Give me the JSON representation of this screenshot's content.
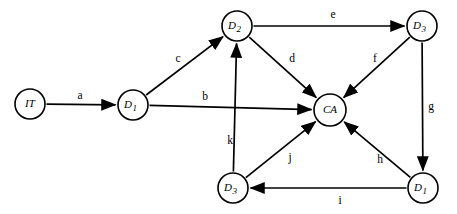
{
  "diagram": {
    "type": "directed-graph",
    "title": "",
    "background_color": "#ffffff",
    "stroke_color": "#000000",
    "node_fill_color": "#ffffff",
    "nodes": [
      {
        "id": "IT",
        "label": "IT",
        "base": "IT",
        "sub": "",
        "cx": 30,
        "cy": 104,
        "r": 15
      },
      {
        "id": "D1a",
        "label": "D1",
        "base": "D",
        "sub": "1",
        "cx": 133,
        "cy": 105,
        "r": 15
      },
      {
        "id": "D2",
        "label": "D2",
        "base": "D",
        "sub": "2",
        "cx": 237,
        "cy": 26,
        "r": 15
      },
      {
        "id": "D3top",
        "label": "D3",
        "base": "D",
        "sub": "3",
        "cx": 422,
        "cy": 26,
        "r": 15
      },
      {
        "id": "CA",
        "label": "CA",
        "base": "CA",
        "sub": "",
        "cx": 330,
        "cy": 110,
        "r": 16
      },
      {
        "id": "D3bot",
        "label": "D3",
        "base": "D",
        "sub": "3",
        "cx": 233,
        "cy": 188,
        "r": 15
      },
      {
        "id": "D1b",
        "label": "D1",
        "base": "D",
        "sub": "1",
        "cx": 423,
        "cy": 188,
        "r": 15
      }
    ],
    "edges": [
      {
        "id": "a",
        "label": "a",
        "from": "IT",
        "to": "D1a",
        "label_x": 80,
        "label_y": 96
      },
      {
        "id": "b",
        "label": "b",
        "from": "D1a",
        "to": "CA",
        "label_x": 205,
        "label_y": 97
      },
      {
        "id": "c",
        "label": "c",
        "from": "D1a",
        "to": "D2",
        "label_x": 178,
        "label_y": 59
      },
      {
        "id": "d",
        "label": "d",
        "from": "D2",
        "to": "CA",
        "label_x": 292,
        "label_y": 59
      },
      {
        "id": "e",
        "label": "e",
        "from": "D2",
        "to": "D3top",
        "label_x": 333,
        "label_y": 15
      },
      {
        "id": "f",
        "label": "f",
        "from": "D3top",
        "to": "CA",
        "label_x": 375,
        "label_y": 59
      },
      {
        "id": "g",
        "label": "g",
        "from": "D3top",
        "to": "D1b",
        "label_x": 431,
        "label_y": 107
      },
      {
        "id": "h",
        "label": "h",
        "from": "D1b",
        "to": "CA",
        "label_x": 380,
        "label_y": 160
      },
      {
        "id": "i",
        "label": "i",
        "from": "D1b",
        "to": "D3bot",
        "label_x": 340,
        "label_y": 201
      },
      {
        "id": "j",
        "label": "j",
        "from": "D3bot",
        "to": "CA",
        "label_x": 290,
        "label_y": 158
      },
      {
        "id": "k",
        "label": "k",
        "from": "D3bot",
        "to": "D2",
        "label_x": 230,
        "label_y": 141
      }
    ]
  }
}
